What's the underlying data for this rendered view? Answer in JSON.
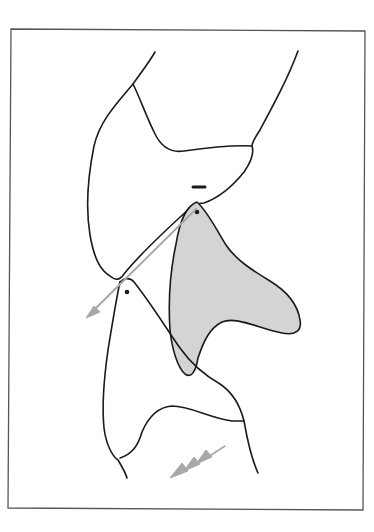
{
  "figure": {
    "width": 374,
    "height": 532,
    "background": "#ffffff",
    "frame": {
      "x1": 11,
      "y1": 29,
      "x2": 365,
      "y2": 31,
      "x3": 363,
      "y3": 510,
      "x4": 8,
      "y4": 508,
      "stroke": "#555555",
      "stroke_width": 1.3
    },
    "colors": {
      "outline": "#1a1a1a",
      "shaded_fill": "#d4d4d4",
      "arrow": "#a8a8a8"
    },
    "upper_tooth": {
      "label": "upper-tooth",
      "outline": "M155,52 C148,64 140,74 133,84 C118,102 100,120 94,146 C88,176 85,205 90,235 C94,258 100,270 110,276 C116,281 120,280 124,274 C140,254 168,228 190,208 C196,204 200,203 204,203 C218,198 232,187 244,172 C251,162 254,152 252,146 C252,142 256,136 260,130 C275,102 288,78 298,51",
      "crown_line": "M133,84 C140,98 146,116 155,134 C162,148 172,153 184,151 C205,148 230,145 252,146",
      "contact_mark": {
        "x1": 193,
        "y1": 187,
        "x2": 205,
        "y2": 187,
        "stroke_width": 3
      },
      "cusp_dot": {
        "cx": 197,
        "cy": 212,
        "r": 2.3
      }
    },
    "shaded_tooth": {
      "label": "shaded-tooth",
      "outline": "M197,202 C186,206 180,220 176,244 C170,272 168,300 170,330 C172,350 178,368 185,374 C192,379 196,370 198,358 C204,340 210,328 222,322 C236,316 258,328 282,333 C296,336 302,330 300,320 C298,306 288,292 270,281 C252,270 236,260 226,245 C216,229 208,212 197,202 Z"
    },
    "lower_tooth": {
      "label": "lower-tooth",
      "outline": "M120,282 C116,300 112,326 108,350 C104,378 102,408 104,428 C106,444 112,456 118,460 C124,470 126,474 127,478",
      "right_outline": "M120,282 C124,278 130,277 134,282 C150,302 166,328 180,348 C192,365 206,376 220,384 C232,392 240,405 244,421 C248,444 252,460 258,473",
      "crown_line": "M120,458 C132,454 138,446 142,432 C148,418 158,407 172,406 C190,406 210,418 232,421 C238,421 242,421 244,421",
      "cusp_dot": {
        "cx": 127,
        "cy": 292,
        "r": 2.3
      }
    },
    "slide_arrow": {
      "label": "slide-direction-arrow",
      "line": {
        "x1": 196,
        "y1": 209,
        "x2": 92,
        "y2": 312
      },
      "head": "M86,318 L100,312 L94,306 Z",
      "stroke_width": 2
    },
    "movement_arrow": {
      "label": "triple-chevron-arrow",
      "line": {
        "x1": 225,
        "y1": 446,
        "x2": 205,
        "y2": 459
      },
      "heads": [
        "M196,464 L212,457 L206,450 Z",
        "M184,471 L200,464 L194,457 Z",
        "M170,478 L188,471 L182,463 Z"
      ]
    }
  }
}
